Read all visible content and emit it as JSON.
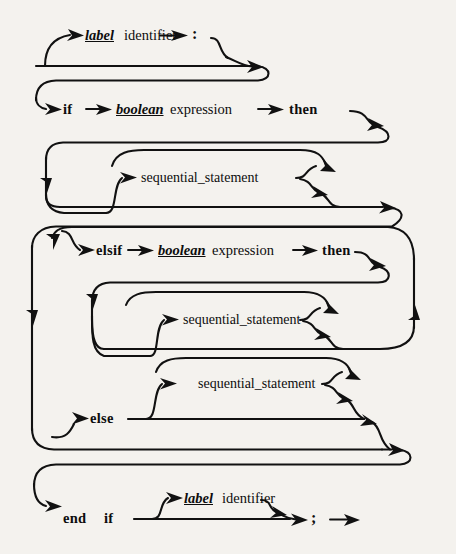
{
  "diagram": {
    "type": "railroad-syntax-diagram",
    "colors": {
      "ink": "#111111",
      "paper": "#f4f2ee"
    },
    "labels": {
      "label_kw": "label",
      "identifier": "identifier",
      "colon": ":",
      "if": "if",
      "boolean": "boolean",
      "expression": "expression",
      "then": "then",
      "sequential_statement": "sequential_statement",
      "elsif": "elsif",
      "else": "else",
      "end": "end",
      "end_if": "if",
      "semicolon": ";"
    },
    "rows": [
      {
        "name": "label-row",
        "terms": [
          "label",
          "identifier",
          ":"
        ],
        "optional": true
      },
      {
        "name": "if-row",
        "terms": [
          "if",
          "boolean",
          "expression",
          "then"
        ],
        "optional": false
      },
      {
        "name": "then-body-row",
        "terms": [
          "sequential_statement"
        ],
        "repeatable": true,
        "optional": true
      },
      {
        "name": "elsif-row",
        "terms": [
          "elsif",
          "boolean",
          "expression",
          "then"
        ],
        "optional": true,
        "repeatable": true
      },
      {
        "name": "elsif-body-row",
        "terms": [
          "sequential_statement"
        ],
        "repeatable": true,
        "optional": true
      },
      {
        "name": "else-body-row",
        "terms": [
          "sequential_statement"
        ],
        "repeatable": true,
        "optional": true
      },
      {
        "name": "else-row",
        "terms": [
          "else"
        ],
        "optional": true
      },
      {
        "name": "end-row",
        "terms": [
          "end",
          "if",
          "label",
          "identifier",
          ";"
        ],
        "optional": false
      }
    ]
  }
}
